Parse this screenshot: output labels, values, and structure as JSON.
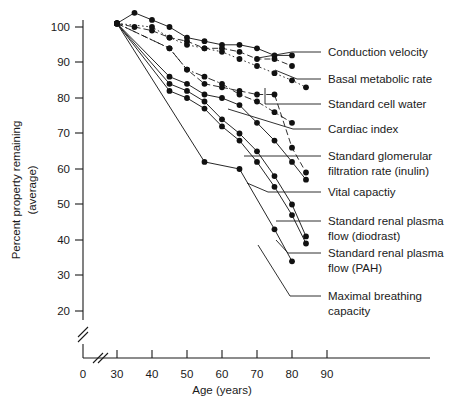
{
  "chart_data": {
    "type": "line",
    "title": "",
    "xlabel": "Age (years)",
    "ylabel": "Percent property remaining (average)",
    "ylabel_line1": "Percent property remaining",
    "ylabel_line2": "(average)",
    "xlim": [
      25,
      95
    ],
    "ylim": [
      15,
      105
    ],
    "xticks": [
      30,
      40,
      50,
      60,
      70,
      80,
      90
    ],
    "xtick_labels": [
      "30",
      "40",
      "50",
      "60",
      "70",
      "80",
      "90"
    ],
    "x_origin_label": "0",
    "yticks": [
      20,
      30,
      40,
      50,
      60,
      70,
      80,
      90,
      100
    ],
    "ytick_labels": [
      "20",
      "30",
      "40",
      "50",
      "60",
      "70",
      "80",
      "90",
      "100"
    ],
    "grid": false,
    "legend_position": "right-leader-lines",
    "axis_break_x": true,
    "axis_break_y": true,
    "series": [
      {
        "name": "Conduction velocity",
        "style": "solid",
        "x": [
          30,
          35,
          40,
          45,
          50,
          55,
          60,
          65,
          70,
          75,
          80
        ],
        "values": [
          101,
          104,
          102,
          100,
          97,
          96,
          95,
          95,
          94,
          92,
          92
        ]
      },
      {
        "name": "Basal metabolic rate",
        "style": "dashed",
        "x": [
          30,
          35,
          40,
          45,
          50,
          55,
          60,
          65,
          70,
          75,
          80
        ],
        "values": [
          101,
          100,
          99,
          97,
          96,
          94,
          94,
          93,
          91,
          91,
          89
        ]
      },
      {
        "name": "Standard cell water",
        "style": "dotted",
        "x": [
          30,
          40,
          45,
          50,
          55,
          60,
          65,
          70,
          75,
          80,
          84
        ],
        "values": [
          101,
          100,
          97,
          95,
          94,
          93,
          91,
          89,
          87,
          85,
          83
        ]
      },
      {
        "name": "Cardiac index",
        "style": "dashdot",
        "x": [
          30,
          45,
          50,
          55,
          60,
          65,
          70,
          75,
          80
        ],
        "values": [
          101,
          94,
          88,
          86,
          84,
          81,
          79,
          76,
          73
        ]
      },
      {
        "name": "Standard glomerular filtration rate (inulin)",
        "style": "dashed",
        "x": [
          30,
          45,
          50,
          55,
          60,
          65,
          70,
          75,
          80,
          84
        ],
        "values": [
          101,
          94,
          88,
          84,
          83,
          82,
          81,
          81,
          66,
          59
        ]
      },
      {
        "name": "Vital capactiy",
        "style": "solid",
        "x": [
          30,
          45,
          50,
          55,
          60,
          65,
          70,
          75,
          80,
          84
        ],
        "values": [
          101,
          86,
          84,
          81,
          80,
          78,
          73,
          68,
          62,
          57
        ]
      },
      {
        "name": "Standard renal plasma flow (diodrast)",
        "style": "solid",
        "x": [
          30,
          45,
          50,
          55,
          60,
          65,
          70,
          75,
          80,
          84
        ],
        "values": [
          101,
          84,
          82,
          79,
          74,
          70,
          65,
          58,
          50,
          41
        ]
      },
      {
        "name": "Standard renal plasma flow (PAH)",
        "style": "solid",
        "x": [
          30,
          45,
          50,
          55,
          60,
          65,
          70,
          75,
          80,
          84
        ],
        "values": [
          101,
          82,
          80,
          77,
          72,
          68,
          62,
          55,
          47,
          39
        ]
      },
      {
        "name": "Maximal breathing capacity",
        "style": "solid",
        "x": [
          30,
          55,
          65,
          75,
          80
        ],
        "values": [
          101,
          62,
          60,
          43,
          34
        ]
      }
    ],
    "annotations": [
      {
        "label": "Conduction velocity",
        "label_lines": [
          "Conduction velocity"
        ]
      },
      {
        "label": "Basal metabolic rate",
        "label_lines": [
          "Basal metabolic rate"
        ]
      },
      {
        "label": "Standard cell water",
        "label_lines": [
          "Standard cell water"
        ]
      },
      {
        "label": "Cardiac index",
        "label_lines": [
          "Cardiac index"
        ]
      },
      {
        "label": "Standard glomerular filtration rate (inulin)",
        "label_lines": [
          "Standard glomerular",
          "filtration rate (inulin)"
        ]
      },
      {
        "label": "Vital capactiy",
        "label_lines": [
          "Vital capactiy"
        ]
      },
      {
        "label": "Standard renal plasma flow (diodrast)",
        "label_lines": [
          "Standard renal plasma",
          "flow (diodrast)"
        ]
      },
      {
        "label": "Standard renal plasma flow (PAH)",
        "label_lines": [
          "Standard renal plasma",
          "flow (PAH)"
        ]
      },
      {
        "label": "Maximal breathing capacity",
        "label_lines": [
          "Maximal breathing",
          "capacity"
        ]
      }
    ]
  },
  "labels": {
    "l0a": "Conduction velocity",
    "l1a": "Basal metabolic rate",
    "l2a": "Standard cell water",
    "l3a": "Cardiac index",
    "l4a": "Standard glomerular",
    "l4b": "filtration rate (inulin)",
    "l5a": "Vital capactiy",
    "l6a": "Standard renal plasma",
    "l6b": "flow (diodrast)",
    "l7a": "Standard renal plasma",
    "l7b": "flow (PAH)",
    "l8a": "Maximal breathing",
    "l8b": "capacity"
  },
  "axes": {
    "x_title": "Age (years)",
    "y_title_1": "Percent property remaining",
    "y_title_2": "(average)",
    "x0": "0",
    "x30": "30",
    "x40": "40",
    "x50": "50",
    "x60": "60",
    "x70": "70",
    "x80": "80",
    "x90": "90",
    "y20": "20",
    "y30": "30",
    "y40": "40",
    "y50": "50",
    "y60": "60",
    "y70": "70",
    "y80": "80",
    "y90": "90",
    "y100": "100"
  }
}
